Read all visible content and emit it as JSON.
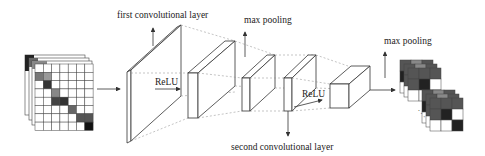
{
  "diagram": {
    "labels": {
      "first_conv": "first convolutional layer",
      "max_pool_1": "max pooling",
      "relu_1": "ReLU",
      "relu_2": "ReLU",
      "second_conv": "second convolutional layer",
      "max_pool_2": "max pooling"
    },
    "colors": {
      "line": "#333333",
      "dashed": "#888888",
      "cell_dark": "#1a1a1a",
      "cell_mid": "#555555",
      "cell_light": "#999999",
      "cell_empty": "#ffffff"
    },
    "nodes": [
      {
        "id": "input",
        "label": "input feature maps"
      },
      {
        "id": "conv1",
        "label": "first convolutional layer"
      },
      {
        "id": "relu1-out",
        "label": "ReLU output"
      },
      {
        "id": "pool1",
        "label": "max pooling"
      },
      {
        "id": "conv2",
        "label": "second convolutional layer"
      },
      {
        "id": "relu2-out",
        "label": "ReLU output"
      },
      {
        "id": "output",
        "label": "pooled feature maps"
      }
    ]
  }
}
